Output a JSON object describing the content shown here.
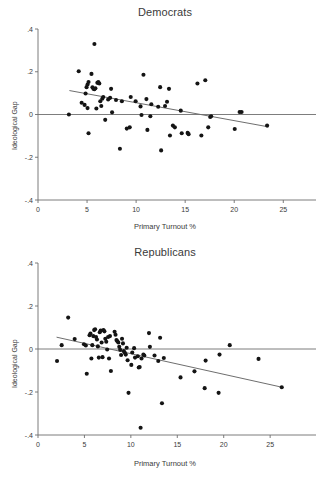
{
  "figure": {
    "background_color": "#ffffff",
    "point_color": "#141414",
    "line_color": "#6e6e6e",
    "axis_color": "#6e6e6e",
    "text_color": "#3a3a3a"
  },
  "panels": [
    {
      "key": "democrats",
      "title": "Democrats",
      "xlabel": "Primary Turnout %",
      "ylabel": "Ideological Gap"
    },
    {
      "key": "republicans",
      "title": "Republicans",
      "xlabel": "Primary Turnout %",
      "ylabel": "Ideological Gap"
    }
  ],
  "chart_data": [
    {
      "type": "scatter",
      "title": "Democrats",
      "xlabel": "Primary Turnout %",
      "ylabel": "Ideological Gap",
      "xlim": [
        0,
        26.5
      ],
      "ylim": [
        -0.4,
        0.4
      ],
      "xticks": [
        0,
        5,
        10,
        15,
        20,
        25
      ],
      "xticklabels": [
        "0",
        "5",
        "10",
        "15",
        "20",
        "25"
      ],
      "yticks": [
        -0.4,
        -0.2,
        0,
        0.2,
        0.4
      ],
      "yticklabels": [
        "-.4",
        "-.2",
        "0",
        ".2",
        ".4"
      ],
      "grid": false,
      "legend": "none",
      "reference_line": {
        "y": 0,
        "color": "#6e6e6e"
      },
      "fit_line": {
        "x": [
          3.2,
          23.5
        ],
        "y": [
          0.112,
          -0.058
        ],
        "color": "#6e6e6e"
      },
      "points": [
        [
          3.15,
          0.0
        ],
        [
          4.15,
          0.202
        ],
        [
          4.45,
          0.055
        ],
        [
          4.75,
          0.045
        ],
        [
          4.85,
          0.098
        ],
        [
          4.95,
          0.128
        ],
        [
          5.05,
          0.14
        ],
        [
          5.15,
          0.152
        ],
        [
          5.05,
          0.03
        ],
        [
          5.15,
          -0.088
        ],
        [
          5.45,
          0.19
        ],
        [
          5.55,
          0.127
        ],
        [
          5.65,
          0.12
        ],
        [
          5.75,
          0.118
        ],
        [
          5.85,
          0.123
        ],
        [
          5.75,
          0.33
        ],
        [
          5.95,
          0.028
        ],
        [
          6.05,
          0.148
        ],
        [
          6.15,
          0.152
        ],
        [
          6.25,
          0.145
        ],
        [
          6.35,
          0.062
        ],
        [
          6.45,
          0.04
        ],
        [
          6.55,
          0.074
        ],
        [
          6.65,
          0.082
        ],
        [
          6.85,
          -0.025
        ],
        [
          7.15,
          0.07
        ],
        [
          7.35,
          0.078
        ],
        [
          7.45,
          0.12
        ],
        [
          7.55,
          0.01
        ],
        [
          7.95,
          0.068
        ],
        [
          8.35,
          -0.16
        ],
        [
          8.55,
          0.062
        ],
        [
          9.05,
          -0.066
        ],
        [
          9.35,
          -0.06
        ],
        [
          9.45,
          0.082
        ],
        [
          9.95,
          0.062
        ],
        [
          10.45,
          0.038
        ],
        [
          10.55,
          -0.002
        ],
        [
          10.75,
          0.186
        ],
        [
          11.05,
          0.072
        ],
        [
          11.15,
          -0.072
        ],
        [
          11.45,
          -0.008
        ],
        [
          11.55,
          0.048
        ],
        [
          12.25,
          0.036
        ],
        [
          12.45,
          0.128
        ],
        [
          12.55,
          -0.168
        ],
        [
          12.95,
          0.04
        ],
        [
          13.15,
          0.06
        ],
        [
          13.35,
          0.12
        ],
        [
          13.45,
          -0.098
        ],
        [
          13.75,
          -0.052
        ],
        [
          13.95,
          -0.06
        ],
        [
          14.55,
          0.018
        ],
        [
          14.65,
          -0.088
        ],
        [
          15.25,
          -0.086
        ],
        [
          15.35,
          -0.092
        ],
        [
          16.25,
          0.145
        ],
        [
          16.65,
          -0.098
        ],
        [
          17.05,
          0.16
        ],
        [
          17.35,
          -0.06
        ],
        [
          17.55,
          -0.012
        ],
        [
          17.65,
          -0.008
        ],
        [
          20.05,
          -0.068
        ],
        [
          20.55,
          0.012
        ],
        [
          20.75,
          0.012
        ],
        [
          23.35,
          -0.052
        ]
      ]
    },
    {
      "type": "scatter",
      "title": "Republicans",
      "xlabel": "Primary Turnout %",
      "ylabel": "Ideological Gap",
      "xlim": [
        0,
        28.0
      ],
      "ylim": [
        -0.4,
        0.4
      ],
      "xticks": [
        0,
        5,
        10,
        15,
        20,
        25
      ],
      "xticklabels": [
        "0",
        "5",
        "10",
        "15",
        "20",
        "25"
      ],
      "yticks": [
        -0.4,
        -0.2,
        0,
        0.2,
        0.4
      ],
      "yticklabels": [
        "-.4",
        "-.2",
        "0",
        ".2",
        ".4"
      ],
      "grid": false,
      "legend": "none",
      "reference_line": {
        "y": 0,
        "color": "#6e6e6e"
      },
      "fit_line": {
        "x": [
          2.0,
          26.3
        ],
        "y": [
          0.055,
          -0.178
        ],
        "color": "#6e6e6e"
      },
      "points": [
        [
          2.05,
          -0.056
        ],
        [
          2.55,
          0.018
        ],
        [
          3.25,
          0.146
        ],
        [
          3.95,
          0.046
        ],
        [
          4.95,
          0.022
        ],
        [
          5.15,
          0.016
        ],
        [
          5.25,
          -0.115
        ],
        [
          5.55,
          0.064
        ],
        [
          5.65,
          0.072
        ],
        [
          5.75,
          -0.044
        ],
        [
          5.85,
          0.018
        ],
        [
          5.95,
          0.06
        ],
        [
          6.05,
          0.088
        ],
        [
          6.15,
          0.092
        ],
        [
          6.25,
          0.056
        ],
        [
          6.35,
          0.044
        ],
        [
          6.45,
          0.012
        ],
        [
          6.55,
          -0.04
        ],
        [
          6.65,
          0.078
        ],
        [
          6.75,
          0.086
        ],
        [
          6.85,
          0.03
        ],
        [
          6.95,
          -0.038
        ],
        [
          7.05,
          0.088
        ],
        [
          7.15,
          0.082
        ],
        [
          7.25,
          0.048
        ],
        [
          7.35,
          0.034
        ],
        [
          7.45,
          -0.002
        ],
        [
          7.55,
          0.056
        ],
        [
          7.65,
          -0.044
        ],
        [
          7.75,
          0.06
        ],
        [
          7.85,
          -0.102
        ],
        [
          8.25,
          0.08
        ],
        [
          8.35,
          0.066
        ],
        [
          8.45,
          0.042
        ],
        [
          8.55,
          0.036
        ],
        [
          8.65,
          0.03
        ],
        [
          8.75,
          0.01
        ],
        [
          8.85,
          -0.004
        ],
        [
          8.95,
          -0.028
        ],
        [
          9.05,
          0.048
        ],
        [
          9.15,
          0.026
        ],
        [
          9.25,
          -0.01
        ],
        [
          9.35,
          -0.018
        ],
        [
          9.45,
          -0.026
        ],
        [
          9.55,
          0.006
        ],
        [
          9.65,
          -0.052
        ],
        [
          9.75,
          -0.204
        ],
        [
          10.05,
          -0.074
        ],
        [
          10.15,
          -0.016
        ],
        [
          10.35,
          0.004
        ],
        [
          10.45,
          -0.04
        ],
        [
          10.75,
          -0.034
        ],
        [
          10.85,
          -0.086
        ],
        [
          10.95,
          -0.084
        ],
        [
          11.05,
          -0.366
        ],
        [
          11.15,
          -0.044
        ],
        [
          11.35,
          -0.026
        ],
        [
          11.45,
          -0.03
        ],
        [
          11.95,
          0.074
        ],
        [
          12.05,
          0.01
        ],
        [
          12.55,
          -0.03
        ],
        [
          12.95,
          -0.056
        ],
        [
          13.15,
          0.052
        ],
        [
          13.35,
          -0.252
        ],
        [
          13.55,
          -0.042
        ],
        [
          15.35,
          -0.132
        ],
        [
          16.85,
          -0.104
        ],
        [
          17.95,
          -0.182
        ],
        [
          18.05,
          -0.054
        ],
        [
          19.45,
          -0.204
        ],
        [
          19.55,
          -0.026
        ],
        [
          20.65,
          0.018
        ],
        [
          23.75,
          -0.046
        ],
        [
          26.25,
          -0.178
        ]
      ]
    }
  ]
}
